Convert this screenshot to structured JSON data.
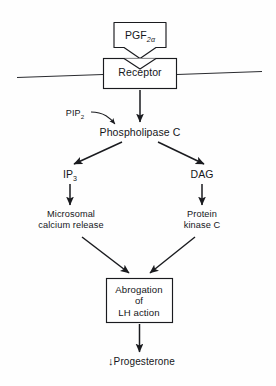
{
  "diagram": {
    "background_color": "#fefefe",
    "stroke_color": "#1a1b1f",
    "text_color": "#15161a",
    "nodes": {
      "ligand": {
        "label_main": "PGF",
        "label_sub": "2α",
        "shape": "notched-box"
      },
      "receptor": {
        "label": "Receptor",
        "shape": "box"
      },
      "pip2": {
        "label_main": "PIP",
        "label_sub": "2",
        "shape": "plain-text"
      },
      "phospholipase_c": {
        "label": "Phospholipase C",
        "shape": "plain-text"
      },
      "ip3": {
        "label_main": "IP",
        "label_sub": "3",
        "shape": "plain-text"
      },
      "dag": {
        "label": "DAG",
        "shape": "plain-text"
      },
      "microsomal_calcium_release": {
        "line1": "Microsomal",
        "line2": "calcium release",
        "shape": "plain-text"
      },
      "protein_kinase_c": {
        "line1": "Protein",
        "line2": "kinase C",
        "shape": "plain-text"
      },
      "abrogation_lh": {
        "line1": "Abrogation",
        "line2": "of",
        "line3": "LH action",
        "shape": "box"
      },
      "progesterone": {
        "arrow": "↓",
        "label": "Progesterone",
        "shape": "plain-text"
      }
    },
    "membrane": {
      "name": "cell-membrane-line",
      "description": "horizontal line through receptor"
    },
    "edges": [
      {
        "from": "receptor",
        "to": "phospholipase_c",
        "style": "straight-arrow"
      },
      {
        "from": "pip2",
        "to": "phospholipase_c",
        "style": "curved-arrow"
      },
      {
        "from": "phospholipase_c",
        "to": "ip3",
        "style": "diagonal-arrow"
      },
      {
        "from": "phospholipase_c",
        "to": "dag",
        "style": "diagonal-arrow"
      },
      {
        "from": "ip3",
        "to": "microsomal_calcium_release",
        "style": "straight-arrow"
      },
      {
        "from": "dag",
        "to": "protein_kinase_c",
        "style": "straight-arrow"
      },
      {
        "from": "microsomal_calcium_release",
        "to": "abrogation_lh",
        "style": "diagonal-arrow"
      },
      {
        "from": "protein_kinase_c",
        "to": "abrogation_lh",
        "style": "diagonal-arrow"
      },
      {
        "from": "abrogation_lh",
        "to": "progesterone",
        "style": "straight-arrow"
      }
    ]
  }
}
